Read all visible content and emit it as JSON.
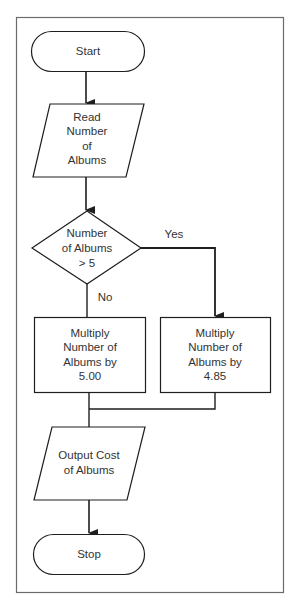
{
  "colors": {
    "stroke": "#1e1e1e",
    "frame": "#6b6b6b",
    "text": "#333333",
    "background": "#ffffff"
  },
  "flowchart": {
    "start": {
      "label": "Start"
    },
    "read": {
      "lines": [
        "Read",
        "Number",
        "of",
        "Albums"
      ]
    },
    "decision": {
      "lines": [
        "Number",
        "of Albums",
        "> 5"
      ]
    },
    "yes_label": "Yes",
    "no_label": "No",
    "multiply_no": {
      "lines": [
        "Multiply",
        "Number of",
        "Albums by",
        "5.00"
      ]
    },
    "multiply_yes": {
      "lines": [
        "Multiply",
        "Number of",
        "Albums by",
        "4.85"
      ]
    },
    "output": {
      "lines": [
        "Output Cost",
        "of Albums"
      ]
    },
    "stop": {
      "label": "Stop"
    }
  }
}
